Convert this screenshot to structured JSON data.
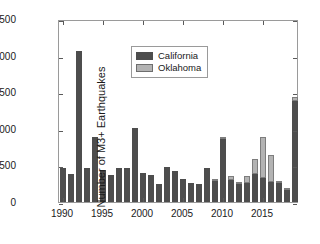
{
  "chart_data": {
    "type": "bar",
    "subtype": "stacked",
    "title": "",
    "xlabel": "",
    "ylabel": "Number of M3+ Earthquakes",
    "xlim": [
      1989.5,
      2019.5
    ],
    "ylim": [
      0,
      2500
    ],
    "yticks": [
      0,
      500,
      1000,
      1500,
      2000,
      2500
    ],
    "ytick_labels": [
      "0",
      "500",
      "1000",
      "1500",
      "2000",
      "2500"
    ],
    "xticks": [
      1990,
      1995,
      2000,
      2005,
      2010,
      2015
    ],
    "xtick_labels": [
      "1990",
      "1995",
      "2000",
      "2005",
      "2010",
      "2015"
    ],
    "grid": false,
    "legend_position": "upper left",
    "categories": [
      1990,
      1991,
      1992,
      1993,
      1994,
      1995,
      1996,
      1997,
      1998,
      1999,
      2000,
      2001,
      2002,
      2003,
      2004,
      2005,
      2006,
      2007,
      2008,
      2009,
      2010,
      2011,
      2012,
      2013,
      2014,
      2015,
      2016,
      2017,
      2018,
      2019
    ],
    "series": [
      {
        "name": "California",
        "color": "#4d4d4d",
        "values": [
          465,
          385,
          2060,
          465,
          890,
          440,
          375,
          470,
          470,
          1010,
          390,
          370,
          250,
          480,
          420,
          320,
          255,
          240,
          460,
          290,
          855,
          295,
          250,
          255,
          385,
          330,
          275,
          265,
          170,
          1385
        ]
      },
      {
        "name": "Oklahoma",
        "color": "#b3b3b3",
        "values": [
          0,
          0,
          0,
          0,
          0,
          0,
          0,
          0,
          0,
          0,
          0,
          0,
          0,
          0,
          0,
          0,
          0,
          0,
          0,
          15,
          40,
          55,
          25,
          100,
          205,
          560,
          370,
          10,
          10,
          50
        ]
      }
    ]
  },
  "legend": {
    "items": [
      {
        "label": "California",
        "swatch": "legend-swatch-california"
      },
      {
        "label": "Oklahoma",
        "swatch": "legend-swatch-oklahoma"
      }
    ]
  },
  "axes": {
    "y_axis_title": "Number of M3+ Earthquakes"
  }
}
